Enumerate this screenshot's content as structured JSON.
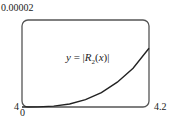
{
  "chart_data": {
    "type": "line",
    "title": "",
    "xlabel": "",
    "ylabel": "",
    "xlim": [
      4,
      4.2
    ],
    "ylim": [
      0,
      2e-05
    ],
    "grid": false,
    "x_tick_labels": [
      "4",
      "4.2"
    ],
    "y_tick_labels": [
      "0",
      "0.00002"
    ],
    "annotations": [
      "y = |R2(x)|"
    ],
    "series": [
      {
        "name": "y = |R_2(x)|",
        "x": [
          4.0,
          4.025,
          4.05,
          4.075,
          4.1,
          4.125,
          4.15,
          4.175,
          4.2
        ],
        "y": [
          0.0,
          3e-08,
          2e-07,
          7e-07,
          1.7e-06,
          3.3e-06,
          5.7e-06,
          8.9e-06,
          1.35e-05
        ]
      }
    ]
  },
  "labels": {
    "y_max": "0.00002",
    "y_min": "0",
    "x_min": "4",
    "x_max": "4.2",
    "curve_prefix": "y = |",
    "curve_func": "R",
    "curve_sub": "2",
    "curve_arg": "(x)|"
  },
  "colors": {
    "frame": "#555555",
    "curve": "#222222",
    "text": "#222222"
  }
}
